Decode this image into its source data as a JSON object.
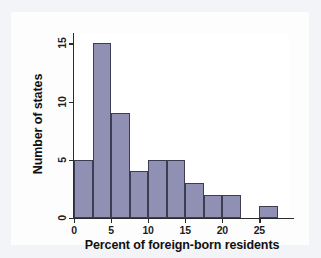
{
  "chart_data": {
    "type": "bar",
    "title": "",
    "xlabel": "Percent of foreign-born residents",
    "ylabel": "Number of states",
    "xlim": [
      0,
      29
    ],
    "ylim": [
      0,
      15.8
    ],
    "grid": false,
    "legend": null,
    "bin_width": 2.5,
    "x_ticks": [
      "0",
      "5",
      "10",
      "15",
      "20",
      "25"
    ],
    "x_tick_values": [
      0,
      5,
      10,
      15,
      20,
      25
    ],
    "y_ticks": [
      "0",
      "5",
      "10",
      "15"
    ],
    "y_tick_values": [
      0,
      5,
      10,
      15
    ],
    "categories": [
      "0-2.5",
      "2.5-5",
      "5-7.5",
      "7.5-10",
      "10-12.5",
      "12.5-15",
      "15-17.5",
      "17.5-20",
      "20-22.5",
      "22.5-25",
      "25-27.5"
    ],
    "bin_starts": [
      0,
      2.5,
      5,
      7.5,
      10,
      12.5,
      15,
      17.5,
      20,
      22.5,
      25
    ],
    "values": [
      5,
      15,
      9,
      4,
      5,
      5,
      3,
      2,
      2,
      0,
      1
    ],
    "bar_color": "#8f90b4",
    "bar_edge_color": "#3d3d52",
    "axis_color": "#2b2b2b",
    "background_color": "#ffffff"
  }
}
